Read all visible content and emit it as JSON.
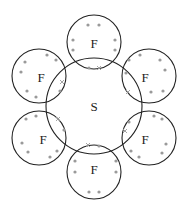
{
  "diagram": {
    "colors": {
      "line": "#222222",
      "electron": "#9a9a9a",
      "background": "#ffffff"
    },
    "central_atom": {
      "label": "S",
      "cx": 94,
      "cy": 106,
      "r": 48
    },
    "outer_atoms": [
      {
        "label": "F",
        "cx": 94,
        "cy": 42,
        "r": 27,
        "lx": 94,
        "ly": 43,
        "dots": [
          [
            88,
            25
          ],
          [
            99,
            25
          ],
          [
            73,
            40
          ],
          [
            73,
            50
          ],
          [
            115,
            40
          ],
          [
            115,
            50
          ],
          [
            89,
            68
          ]
        ],
        "crosses": [
          [
            99,
            68
          ]
        ]
      },
      {
        "label": "F",
        "cx": 149,
        "cy": 76,
        "r": 27,
        "lx": 145,
        "ly": 77,
        "dots": [
          [
            140,
            55
          ],
          [
            129,
            60
          ],
          [
            160,
            60
          ],
          [
            165,
            70
          ],
          [
            163,
            91
          ],
          [
            151,
            92
          ],
          [
            126,
            73
          ]
        ],
        "crosses": [
          [
            128,
            92
          ]
        ]
      },
      {
        "label": "F",
        "cx": 149,
        "cy": 138,
        "r": 27,
        "lx": 145,
        "ly": 139,
        "dots": [
          [
            154,
            116
          ],
          [
            162,
            119
          ],
          [
            166,
            144
          ],
          [
            162,
            153
          ],
          [
            139,
            157
          ],
          [
            131,
            151
          ],
          [
            129,
            122
          ]
        ],
        "crosses": [
          [
            125,
            131
          ]
        ]
      },
      {
        "label": "F",
        "cx": 94,
        "cy": 172,
        "r": 27,
        "lx": 94,
        "ly": 169,
        "dots": [
          [
            99,
            146
          ],
          [
            75,
            161
          ],
          [
            75,
            172
          ],
          [
            116,
            161
          ],
          [
            116,
            172
          ],
          [
            89,
            192
          ],
          [
            99,
            192
          ]
        ],
        "crosses": [
          [
            88,
            145
          ]
        ]
      },
      {
        "label": "F",
        "cx": 39,
        "cy": 138,
        "r": 27,
        "lx": 43,
        "ly": 139,
        "dots": [
          [
            36,
            116
          ],
          [
            26,
            119
          ],
          [
            22,
            143
          ],
          [
            28,
            152
          ],
          [
            50,
            157
          ],
          [
            57,
            151
          ],
          [
            64,
            130
          ]
        ],
        "crosses": [
          [
            58,
            119
          ]
        ]
      },
      {
        "label": "F",
        "cx": 39,
        "cy": 76,
        "r": 27,
        "lx": 41,
        "ly": 77,
        "dots": [
          [
            47,
            55
          ],
          [
            56,
            60
          ],
          [
            25,
            62
          ],
          [
            21,
            72
          ],
          [
            27,
            91
          ],
          [
            36,
            97
          ],
          [
            60,
            91
          ]
        ],
        "crosses": [
          [
            62,
            82
          ]
        ]
      }
    ]
  }
}
